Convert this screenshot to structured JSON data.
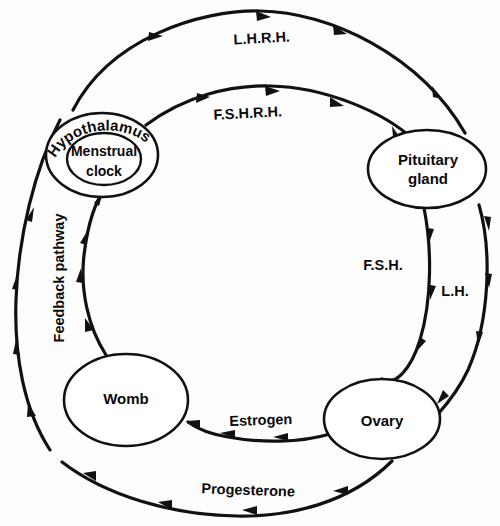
{
  "diagram": {
    "type": "cycle-diagram",
    "background_color": "#fdfdfd",
    "line_color": "#111111",
    "nodes": [
      {
        "id": "hypothalamus",
        "label": "Hypothalamus",
        "inner_label_line1": "Menstrual",
        "inner_label_line2": "clock",
        "position": "top-left",
        "shape": "ellipse-nested",
        "cx": 102,
        "cy": 155,
        "rx": 56,
        "ry": 42,
        "inner_rx": 36,
        "inner_ry": 26
      },
      {
        "id": "pituitary",
        "label_line1": "Pituitary",
        "label_line2": "gland",
        "position": "right",
        "shape": "ellipse",
        "cx": 427,
        "cy": 169,
        "rx": 59,
        "ry": 39
      },
      {
        "id": "ovary",
        "label": "Ovary",
        "position": "bottom-right",
        "shape": "ellipse",
        "cx": 382,
        "cy": 419,
        "rx": 58,
        "ry": 40
      },
      {
        "id": "womb",
        "label": "Womb",
        "position": "bottom-left",
        "shape": "ellipse",
        "cx": 126,
        "cy": 400,
        "rx": 62,
        "ry": 46
      }
    ],
    "arcs": [
      {
        "id": "lhrh",
        "label": "L.H.R.H.",
        "from": "hypothalamus",
        "to": "pituitary",
        "direction": "clockwise",
        "ring": "outer",
        "arrow_count": 4
      },
      {
        "id": "fshrh",
        "label": "F.S.H.R.H.",
        "from": "hypothalamus",
        "to": "pituitary",
        "direction": "clockwise",
        "ring": "inner",
        "arrow_count": 4
      },
      {
        "id": "lh",
        "label": "L.H.",
        "from": "pituitary",
        "to": "ovary",
        "direction": "clockwise",
        "ring": "outer",
        "arrow_count": 4
      },
      {
        "id": "fsh",
        "label": "F.S.H.",
        "from": "pituitary",
        "to": "ovary",
        "direction": "clockwise",
        "ring": "inner",
        "arrow_count": 3
      },
      {
        "id": "progesterone",
        "label": "Progesterone",
        "from": "ovary",
        "to": "womb",
        "direction": "clockwise",
        "ring": "outer",
        "arrow_count": 4
      },
      {
        "id": "estrogen",
        "label": "Estrogen",
        "from": "ovary",
        "to": "womb",
        "direction": "clockwise",
        "ring": "inner",
        "arrow_count": 3
      },
      {
        "id": "feedback-outer",
        "label": "Feedback pathway",
        "from": "womb",
        "to": "hypothalamus",
        "direction": "clockwise",
        "ring": "outer",
        "arrow_count": 4
      },
      {
        "id": "feedback-inner",
        "label": "",
        "from": "womb",
        "to": "hypothalamus",
        "direction": "clockwise",
        "ring": "inner",
        "arrow_count": 4
      }
    ],
    "labels": {
      "lhrh": "L.H.R.H.",
      "fshrh": "F.S.H.R.H.",
      "fsh": "F.S.H.",
      "lh": "L.H.",
      "estrogen": "Estrogen",
      "progesterone": "Progesterone",
      "feedback": "Feedback pathway",
      "hypothalamus": "Hypothalamus",
      "menstrual": "Menstrual",
      "clock": "clock",
      "pituitary_line1": "Pituitary",
      "pituitary_line2": "gland",
      "womb": "Womb",
      "ovary": "Ovary"
    }
  }
}
